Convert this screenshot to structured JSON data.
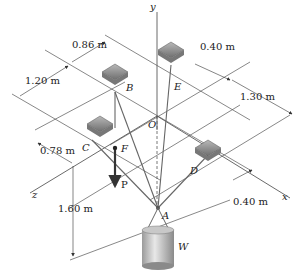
{
  "figure": {
    "problem_number": "P",
    "axes": {
      "x": "x",
      "y": "y",
      "z": "z",
      "origin": "O"
    },
    "points": {
      "A": "A",
      "B": "B",
      "C": "C",
      "D": "D",
      "E": "E",
      "F": "F"
    },
    "loads": {
      "P": "P",
      "W": "W"
    },
    "dimensions": {
      "d1": "0.86 m",
      "d2": "1.20 m",
      "d3": "0.40 m",
      "d4": "1.30 m",
      "d5": "0.78 m",
      "d6": "1.60 m",
      "d7": "0.40 m"
    }
  }
}
